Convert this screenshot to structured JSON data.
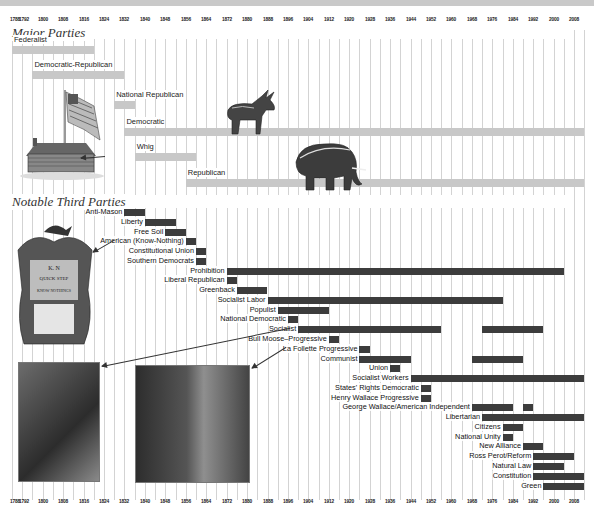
{
  "chart_data": {
    "type": "timeline",
    "title": "",
    "xlabel": "Year",
    "xlim": [
      1788,
      2012
    ],
    "ticks": [
      1788,
      1792,
      1800,
      1808,
      1816,
      1824,
      1832,
      1840,
      1848,
      1856,
      1864,
      1872,
      1880,
      1888,
      1896,
      1904,
      1912,
      1920,
      1928,
      1936,
      1944,
      1952,
      1960,
      1968,
      1976,
      1984,
      1992,
      2000,
      2008
    ],
    "tick_labels": [
      "1788",
      "1792",
      "1800",
      "1808",
      "1816",
      "1824",
      "1832",
      "1840",
      "1848",
      "1856",
      "1864",
      "1872",
      "1880",
      "1888",
      "1896",
      "1904",
      "1912",
      "1920",
      "1928",
      "1936",
      "1944",
      "1952",
      "1960",
      "1968",
      "1976",
      "1984",
      "1992",
      "2000",
      "2008"
    ],
    "grid": true,
    "sections": [
      {
        "title": "Major Parties",
        "bar_color": "#c8c8c8",
        "parties": [
          {
            "name": "Federalist",
            "spans": [
              [
                1788,
                1820
              ]
            ]
          },
          {
            "name": "Democratic-Republican",
            "spans": [
              [
                1796,
                1832
              ]
            ]
          },
          {
            "name": "National Republican",
            "spans": [
              [
                1828,
                1836
              ]
            ]
          },
          {
            "name": "Democratic",
            "spans": [
              [
                1832,
                2012
              ]
            ]
          },
          {
            "name": "Whig",
            "spans": [
              [
                1836,
                1860
              ]
            ]
          },
          {
            "name": "Republican",
            "spans": [
              [
                1856,
                2012
              ]
            ]
          }
        ]
      },
      {
        "title": "Notable Third Parties",
        "bar_color": "#3c3c3c",
        "parties": [
          {
            "name": "Anti-Mason",
            "spans": [
              [
                1832,
                1840
              ]
            ]
          },
          {
            "name": "Liberty",
            "spans": [
              [
                1840,
                1852
              ]
            ]
          },
          {
            "name": "Free Soil",
            "spans": [
              [
                1848,
                1856
              ]
            ]
          },
          {
            "name": "American (Know-Nothing)",
            "spans": [
              [
                1856,
                1860
              ]
            ]
          },
          {
            "name": "Constitutional Union",
            "spans": [
              [
                1860,
                1864
              ]
            ]
          },
          {
            "name": "Southern Democrats",
            "spans": [
              [
                1860,
                1864
              ]
            ]
          },
          {
            "name": "Prohibition",
            "spans": [
              [
                1872,
                2004
              ]
            ]
          },
          {
            "name": "Liberal Republican",
            "spans": [
              [
                1872,
                1876
              ]
            ]
          },
          {
            "name": "Greenback",
            "spans": [
              [
                1876,
                1888
              ]
            ]
          },
          {
            "name": "Socialist Labor",
            "spans": [
              [
                1888,
                1980
              ]
            ]
          },
          {
            "name": "Populist",
            "spans": [
              [
                1892,
                1912
              ]
            ]
          },
          {
            "name": "National Democratic",
            "spans": [
              [
                1896,
                1900
              ]
            ]
          },
          {
            "name": "Socialist",
            "spans": [
              [
                1900,
                1956
              ],
              [
                1972,
                1996
              ]
            ]
          },
          {
            "name": "Bull Moose–Progressive",
            "spans": [
              [
                1912,
                1916
              ]
            ]
          },
          {
            "name": "La Follette Progressive",
            "spans": [
              [
                1924,
                1928
              ]
            ]
          },
          {
            "name": "Communist",
            "spans": [
              [
                1924,
                1944
              ],
              [
                1968,
                1988
              ]
            ]
          },
          {
            "name": "Union",
            "spans": [
              [
                1936,
                1940
              ]
            ]
          },
          {
            "name": "Socialist Workers",
            "spans": [
              [
                1944,
                2012
              ]
            ]
          },
          {
            "name": "States' Rights Democratic",
            "spans": [
              [
                1948,
                1952
              ]
            ]
          },
          {
            "name": "Henry Wallace Progressive",
            "spans": [
              [
                1948,
                1952
              ]
            ]
          },
          {
            "name": "George Wallace/American Independent",
            "spans": [
              [
                1968,
                1984
              ],
              [
                1988,
                1992
              ]
            ]
          },
          {
            "name": "Libertarian",
            "spans": [
              [
                1972,
                2012
              ]
            ]
          },
          {
            "name": "Citizens",
            "spans": [
              [
                1980,
                1988
              ]
            ]
          },
          {
            "name": "National Unity",
            "spans": [
              [
                1980,
                1984
              ]
            ]
          },
          {
            "name": "New Alliance",
            "spans": [
              [
                1988,
                1996
              ]
            ]
          },
          {
            "name": "Ross Perot/Reform",
            "spans": [
              [
                1992,
                2008
              ]
            ]
          },
          {
            "name": "Natural Law",
            "spans": [
              [
                1992,
                2004
              ]
            ]
          },
          {
            "name": "Constitution",
            "spans": [
              [
                1992,
                2012
              ]
            ]
          },
          {
            "name": "Green",
            "spans": [
              [
                1996,
                2012
              ]
            ]
          }
        ]
      }
    ],
    "annotations": [
      "Illustration: log cabin with flag (Whig)",
      "Illustration: donkey (Democratic)",
      "Illustration: elephant (Republican)",
      "Illustration: Know-Nothing 'K.N. Quick Step' sheet music cover",
      "Photo linked to Socialist",
      "Photo linked to La Follette Progressive"
    ]
  },
  "colors": {
    "major_bar": "#c8c8c8",
    "third_bar": "#3c3c3c",
    "grid": "#d3d3d3"
  }
}
